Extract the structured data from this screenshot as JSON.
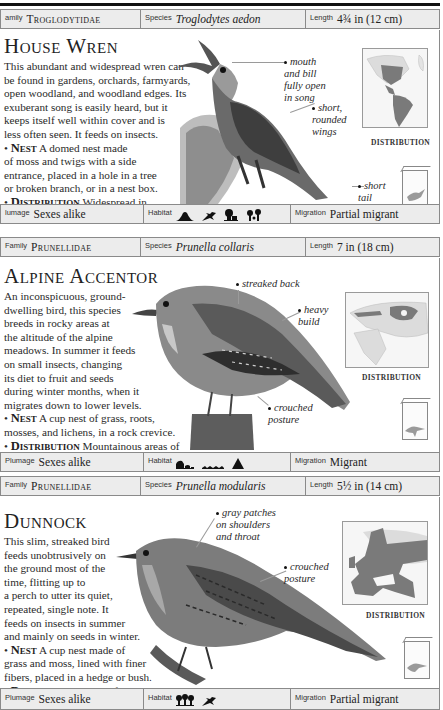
{
  "entries": [
    {
      "header": {
        "family_label": "amily",
        "family": "Troglodytidae",
        "species_label": "Species",
        "species": "Troglodytes aedon",
        "length_label": "Length",
        "length": "4¾ in (12 cm)"
      },
      "title": "House Wren",
      "description": "This abundant and widespread wren can be found in gardens, orchards, farmyards, open woodland, and woodland edges. Its exuberant song is easily heard, but it keeps itself well within cover and is less often seen. It feeds on insects.",
      "nest_label": "Nest",
      "nest": "A domed nest made of moss and twigs with a side entrance, placed in a hole in a tree or broken branch, or in a nest box.",
      "distribution_label": "Distribution",
      "distribution": "Widespread in North, Central, and South America.",
      "callouts": [
        "mouth and bill fully open in song",
        "short, rounded wings",
        "short tail"
      ],
      "callout_lines": [
        [
          "mouth",
          "and bill",
          "fully open",
          "in song"
        ],
        [
          "short,",
          "rounded",
          "wings"
        ],
        [
          "short",
          "tail"
        ]
      ],
      "map_label": "DISTRIBUTION",
      "map_region": "americas",
      "footer": {
        "plumage_label": "Plumage",
        "plumage_label_visible": "lumage",
        "plumage": "Sexes alike",
        "habitat_label": "Habitat",
        "habitat_icons": [
          "mountain-icon",
          "scrub-icon",
          "farmland-icon",
          "woodland-edge-icon"
        ],
        "migration_label": "Migration",
        "migration": "Partial migrant"
      }
    },
    {
      "header": {
        "family_label": "Family",
        "family": "Prunellidae",
        "species_label": "Species",
        "species": "Prunella collaris",
        "length_label": "Length",
        "length": "7 in (18 cm)"
      },
      "title": "Alpine Accentor",
      "description": "An inconspicuous, ground-dwelling bird, this species breeds in rocky areas at the altitude of the alpine meadows. In summer it feeds on small insects, changing its diet to fruit and seeds during winter months, when it migrates down to lower levels.",
      "nest_label": "Nest",
      "nest": "A cup nest of grass, roots, mosses, and lichens, in a rock crevice.",
      "distribution_label": "Distribution",
      "distribution": "Mountainous areas of N.W. Africa, S. Europe, and parts of Asia.",
      "callouts": [
        "streaked back",
        "heavy build",
        "crouched posture"
      ],
      "callout_lines": [
        [
          "streaked back"
        ],
        [
          "heavy",
          "build"
        ],
        [
          "crouched",
          "posture"
        ]
      ],
      "map_label": "DISTRIBUTION",
      "map_region": "eurasia-africa",
      "footer": {
        "plumage_label": "Plumage",
        "plumage": "Sexes alike",
        "habitat_label": "Habitat",
        "habitat_icons": [
          "rocky-icon",
          "grassland-icon",
          "mountain-peak-icon"
        ],
        "migration_label": "Migration",
        "migration": "Migrant"
      }
    },
    {
      "header": {
        "family_label": "Family",
        "family": "Prunellidae",
        "species_label": "Species",
        "species": "Prunella modularis",
        "length_label": "Length",
        "length": "5½ in (14 cm)"
      },
      "title": "Dunnock",
      "description": "This slim, streaked bird feeds unobtrusively on the ground most of the time, flitting up to a perch to utter its quiet, repeated, single note. It feeds on insects in summer and mainly on seeds in winter.",
      "nest_label": "Nest",
      "nest": "A cup nest made of grass and moss, lined with finer fibers, placed in a hedge or bush.",
      "distribution_label": "Distribution",
      "distribution": "Most of Europe and parts of the Middle East.",
      "callouts": [
        "gray patches on shoulders and throat",
        "crouched posture"
      ],
      "callout_lines": [
        [
          "gray patches",
          "on shoulders",
          "and throat"
        ],
        [
          "crouched",
          "posture"
        ]
      ],
      "map_label": "DISTRIBUTION",
      "map_region": "europe",
      "footer": {
        "plumage_label": "Plumage",
        "plumage": "Sexes alike",
        "habitat_label": "Habitat",
        "habitat_icons": [
          "woodland-icon",
          "scrub-icon"
        ],
        "migration_label": "Migration",
        "migration": "Partial migrant"
      }
    }
  ],
  "text_lines": {
    "e0_desc": [
      "This abundant and widespread wren can",
      "be found in gardens, orchards, farmyards,",
      "open woodland, and woodland edges. Its",
      "exuberant song is easily heard, but it",
      "keeps itself well within cover and is",
      "less often seen. It feeds on insects."
    ],
    "e0_nest": [
      "A domed nest made",
      "of moss and twigs with a side",
      "entrance, placed in a hole in a tree",
      "or broken branch, or in a nest box."
    ],
    "e0_dist": [
      "Widespread in",
      "North, Central, and South America."
    ],
    "e1_desc": [
      "An inconspicuous, ground-",
      "dwelling bird, this species",
      "breeds in rocky areas at",
      "the altitude of the alpine",
      "meadows. In summer it feeds",
      "on small insects, changing",
      "its diet to fruit and seeds",
      "during winter months, when it",
      "migrates down to lower levels."
    ],
    "e1_nest": [
      "A cup nest of grass, roots,",
      "mosses, and lichens, in a rock crevice."
    ],
    "e1_dist": [
      "Mountainous areas of",
      "N.W. Africa, S. Europe, and parts of Asia."
    ],
    "e2_desc": [
      "This slim, streaked bird",
      "feeds unobtrusively on",
      "the ground most of the",
      "time, flitting up to",
      "a perch to utter its quiet,",
      "repeated, single note. It",
      "feeds on insects in summer",
      "and mainly on seeds in winter."
    ],
    "e2_nest": [
      "A cup nest made of",
      "grass and moss, lined with finer",
      "fibers, placed in a hedge or bush."
    ],
    "e2_dist": [
      "Most of",
      "Europe and parts of the Middle East."
    ]
  }
}
